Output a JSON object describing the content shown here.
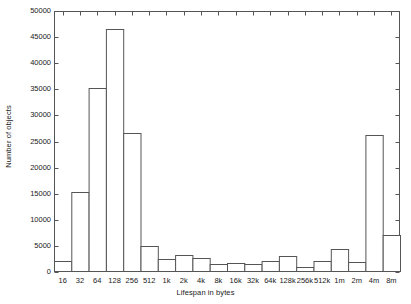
{
  "chart_data": {
    "type": "bar",
    "title": "",
    "subtitle": "",
    "xlabel": "Lifespan in bytes",
    "ylabel": "Number of objects",
    "categories": [
      "16",
      "32",
      "64",
      "128",
      "256",
      "512",
      "1k",
      "2k",
      "4k",
      "8k",
      "16k",
      "32k",
      "64k",
      "128k",
      "256k",
      "512k",
      "1m",
      "2m",
      "4m",
      "8m"
    ],
    "values": [
      2200,
      15300,
      35300,
      46500,
      26600,
      5000,
      2400,
      3300,
      2700,
      1500,
      1800,
      1600,
      2200,
      3000,
      900,
      2100,
      4400,
      1900,
      26200,
      7000
    ],
    "ylim": [
      0,
      50000
    ],
    "ytick_values": [
      0,
      5000,
      10000,
      15000,
      20000,
      25000,
      30000,
      35000,
      40000,
      45000,
      50000
    ],
    "ytick_labels": [
      "0",
      "5000",
      "10000",
      "15000",
      "20000",
      "25000",
      "30000",
      "35000",
      "40000",
      "45000",
      "50000"
    ],
    "grid": false,
    "legend": null,
    "bar_fill_color": "#ffffff",
    "bar_edge_color": "#555555",
    "axis_color": "#555555",
    "text_color": "#1a1a1a",
    "frame": "box",
    "tick_direction": "in"
  }
}
